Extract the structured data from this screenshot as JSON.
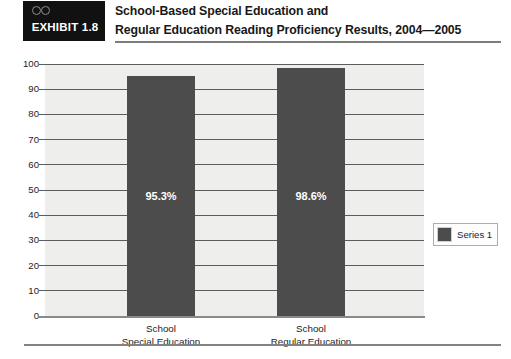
{
  "exhibit": {
    "tag_label": "EXHIBIT 1.8",
    "tag_icon": "spectacles-icon",
    "title_line1": "School-Based Special Education and",
    "title_line2": "Regular Education Reading Proficiency Results, 2004—2005"
  },
  "legend": {
    "series_label": "Series 1",
    "swatch_color": "#4c4c4c",
    "position": "right"
  },
  "colors": {
    "bar": "#4c4c4c",
    "plot_background": "#eeeeec",
    "gridline": "#5c5c5c",
    "tag_background": "#111111",
    "rule": "#7c7c7c"
  },
  "chart_data": {
    "type": "bar",
    "title": "School-Based Special Education and Regular Education Reading Proficiency Results, 2004—2005",
    "xlabel": "",
    "ylabel": "",
    "categories": [
      "School Special Education",
      "School Regular Education"
    ],
    "category_lines": [
      [
        "School",
        "Special Education"
      ],
      [
        "School",
        "Regular Education"
      ]
    ],
    "values": [
      95.3,
      98.6
    ],
    "data_labels": [
      "95.3%",
      "98.6%"
    ],
    "series": [
      {
        "name": "Series 1",
        "values": [
          95.3,
          98.6
        ]
      }
    ],
    "ylim": [
      0,
      100
    ],
    "ytick_step": 10,
    "ytick_labels": [
      "100",
      "90",
      "80",
      "70",
      "60",
      "50",
      "40",
      "30",
      "20",
      "10",
      "0"
    ],
    "grid": true,
    "legend_position": "right"
  }
}
